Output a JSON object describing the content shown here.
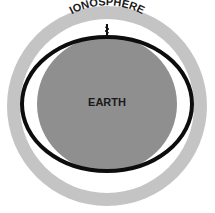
{
  "diagram": {
    "labels": {
      "outer_ring": "IONOSPHERE",
      "center": "EARTH"
    },
    "colors": {
      "background": "#ffffff",
      "ionosphere_ring": "#c4c4c4",
      "gap": "#ffffff",
      "orbit_ellipse": "#0d0d0d",
      "earth": "#8f8f8f",
      "text": "#1a1a1a"
    },
    "elements": [
      {
        "name": "ionosphere-ring",
        "shape": "annulus"
      },
      {
        "name": "orbit-ellipse",
        "shape": "ellipse-outline"
      },
      {
        "name": "earth-disc",
        "shape": "circle"
      },
      {
        "name": "antenna-icon",
        "shape": "glyph"
      }
    ]
  }
}
